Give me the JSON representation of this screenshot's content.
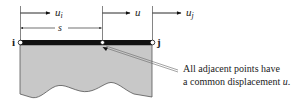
{
  "diagram": {
    "type": "one-dimensional element displacement diagram",
    "nodes": {
      "left_label": "i",
      "right_label": "j"
    },
    "displacements": {
      "left": {
        "symbol": "u",
        "subscript": "i"
      },
      "middle": {
        "symbol": "u",
        "subscript": ""
      },
      "right": {
        "symbol": "u",
        "subscript": "j"
      }
    },
    "distance_label": "s",
    "annotation": {
      "line1": "All adjacent points have",
      "line2_prefix": "a common displacement ",
      "line2_symbol": "u",
      "line2_suffix": "."
    },
    "colors": {
      "bar": "#111111",
      "body_fill": "#c8c8c8",
      "body_stroke": "#555555",
      "leader": "#666666",
      "arrow": "#111111"
    }
  }
}
